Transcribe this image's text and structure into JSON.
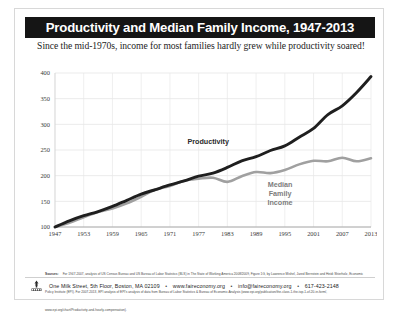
{
  "poster": {
    "title": "Productivity and Median Family Income, 1947-2013",
    "subtitle": "Since the mid-1970s, income for most families hardly grew while productivity soared!"
  },
  "footer": {
    "address": "One Milk Street, 5th Floor, Boston, MA 02109",
    "website": "www.faireconomy.org",
    "email": "info@faireconomy.org",
    "phone": "617-423-2148",
    "separator": "•",
    "logo_name": "united-for-a-fair-economy-logo"
  },
  "source": {
    "label": "Sources:",
    "text": "For 1947-2007, analysis of US Census Bureau and US Bureau of Labor Statistics (BLS) in The State of Working America 2008/2009, Figure 1G, by Lawrence Mishel, Jared Bernstein and Heidi Shierholz, Economic Policy Institute (EPI). For 2007-2013, EPI analysis of EPI's analysis of data from Bureau of Labor Statistics & Bureau of Economic Analysis (www.epi.org/publication/the-class-1-the-top-1-of-20-in-form/, www.epi.org/chart/Productivity-and-hourly-compensation)."
  },
  "chart_data": {
    "type": "line",
    "title": "Productivity and Median Family Income, 1947-2013",
    "xlabel": "",
    "ylabel": "",
    "xlim": [
      1947,
      2013
    ],
    "ylim": [
      100,
      400
    ],
    "yticks": [
      100,
      150,
      200,
      250,
      300,
      350,
      400
    ],
    "xticks": [
      1947,
      1953,
      1959,
      1965,
      1971,
      1977,
      1983,
      1989,
      1995,
      2001,
      2007,
      2013
    ],
    "grid": true,
    "legend_position": "inline-annotation",
    "index_base": "1947 = 100",
    "series": [
      {
        "name": "Productivity",
        "color": "#1f1f1f",
        "label_x": 1979,
        "label_y": 262,
        "x": [
          1947,
          1950,
          1953,
          1956,
          1959,
          1962,
          1965,
          1968,
          1971,
          1974,
          1977,
          1980,
          1983,
          1986,
          1989,
          1992,
          1995,
          1998,
          2001,
          2004,
          2007,
          2010,
          2013
        ],
        "values": [
          100,
          112,
          122,
          130,
          140,
          152,
          164,
          173,
          182,
          190,
          199,
          205,
          216,
          229,
          237,
          249,
          258,
          275,
          292,
          319,
          336,
          362,
          393
        ]
      },
      {
        "name": "Median Family Income",
        "color": "#a0a0a0",
        "label_x": 1994,
        "label_y": 178,
        "x": [
          1947,
          1950,
          1953,
          1956,
          1959,
          1962,
          1965,
          1968,
          1971,
          1974,
          1977,
          1980,
          1983,
          1986,
          1989,
          1992,
          1995,
          1998,
          2001,
          2004,
          2007,
          2010,
          2013
        ],
        "values": [
          100,
          108,
          119,
          129,
          136,
          146,
          159,
          173,
          180,
          190,
          194,
          196,
          188,
          199,
          207,
          205,
          211,
          222,
          229,
          228,
          235,
          228,
          234
        ]
      }
    ],
    "annotations": [
      {
        "text": "Productivity",
        "series": "Productivity"
      },
      {
        "text": "Median",
        "series": "Median Family Income"
      },
      {
        "text": "Family",
        "series": "Median Family Income"
      },
      {
        "text": "Income",
        "series": "Median Family Income"
      }
    ]
  }
}
